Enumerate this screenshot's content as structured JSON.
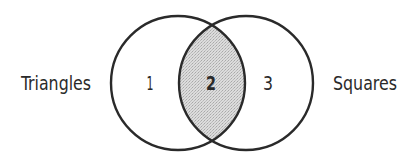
{
  "diagram": {
    "type": "venn",
    "sets": [
      {
        "id": "left",
        "label": "Triangles"
      },
      {
        "id": "right",
        "label": "Squares"
      }
    ],
    "regions": [
      {
        "id": "1",
        "label": "1",
        "description": "Triangles only",
        "shaded": false
      },
      {
        "id": "2",
        "label": "2",
        "description": "Triangles and Squares (intersection)",
        "shaded": true
      },
      {
        "id": "3",
        "label": "3",
        "description": "Squares only",
        "shaded": false
      }
    ],
    "colors": {
      "stroke": "#2a2a2a",
      "shade": "#cfcfcf",
      "background": "#ffffff"
    }
  }
}
